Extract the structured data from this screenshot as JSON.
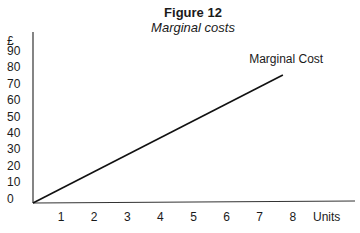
{
  "figure": {
    "title": "Figure 12",
    "subtitle": "Marginal costs"
  },
  "chart_data": {
    "type": "line",
    "title": "Figure 12",
    "subtitle": "Marginal costs",
    "xlabel": "Units",
    "ylabel": "£",
    "x_ticks": [
      "1",
      "2",
      "3",
      "4",
      "5",
      "6",
      "7",
      "8"
    ],
    "y_ticks": [
      "0",
      "10",
      "20",
      "30",
      "40",
      "50",
      "60",
      "70",
      "80",
      "90"
    ],
    "xlim": [
      0,
      9.5
    ],
    "ylim": [
      0,
      95
    ],
    "grid": false,
    "legend": "none",
    "series": [
      {
        "name": "Marginal Cost",
        "x": [
          0,
          7.7
        ],
        "y": [
          0,
          78
        ]
      }
    ],
    "annotations": [
      {
        "text": "Marginal Cost",
        "x": 7.8,
        "y": 84
      }
    ]
  }
}
